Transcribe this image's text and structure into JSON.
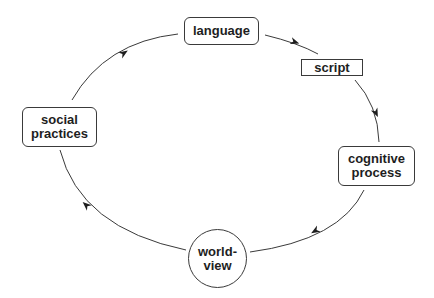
{
  "diagram": {
    "type": "cycle",
    "nodes": [
      {
        "id": "language",
        "label": "language",
        "shape": "rounded-rect"
      },
      {
        "id": "script",
        "label": "script",
        "shape": "rect"
      },
      {
        "id": "cognitive_process",
        "label": "cognitive process",
        "line1": "cognitive",
        "line2": "process",
        "shape": "rounded-rect"
      },
      {
        "id": "world_view",
        "label": "world-view",
        "line1": "world-",
        "line2": "view",
        "shape": "circle"
      },
      {
        "id": "social_practices",
        "label": "social practices",
        "line1": "social",
        "line2": "practices",
        "shape": "rounded-rect"
      }
    ],
    "edges": [
      {
        "from": "language",
        "to": "script"
      },
      {
        "from": "script",
        "to": "cognitive_process"
      },
      {
        "from": "cognitive_process",
        "to": "world_view"
      },
      {
        "from": "world_view",
        "to": "social_practices"
      },
      {
        "from": "social_practices",
        "to": "language"
      }
    ],
    "colors": {
      "stroke": "#3a3a3a",
      "text": "#1e1e1e",
      "background": "#ffffff"
    }
  }
}
